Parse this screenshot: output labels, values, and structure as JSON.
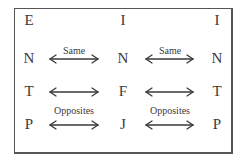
{
  "columns": [
    {
      "x": 29,
      "letters": [
        "E",
        "N",
        "T",
        "P"
      ]
    },
    {
      "x": 123,
      "letters": [
        "I",
        "N",
        "F",
        "J"
      ]
    },
    {
      "x": 217,
      "letters": [
        "I",
        "N",
        "T",
        "P"
      ]
    }
  ],
  "row_y": [
    13,
    51,
    84,
    117
  ],
  "arrow_rows_y": [
    59,
    92,
    125
  ],
  "arrow_groups": [
    {
      "x1": 50,
      "x2": 98
    },
    {
      "x1": 146,
      "x2": 193
    }
  ],
  "labels": [
    {
      "text": "Same",
      "x": 74,
      "y": 46
    },
    {
      "text": "Same",
      "x": 170,
      "y": 46
    },
    {
      "text": "Opposites",
      "x": 74,
      "y": 106
    },
    {
      "text": "Opposites",
      "x": 170,
      "y": 106
    }
  ],
  "colors": {
    "text": "#3a3a3a",
    "border": "#555555"
  }
}
